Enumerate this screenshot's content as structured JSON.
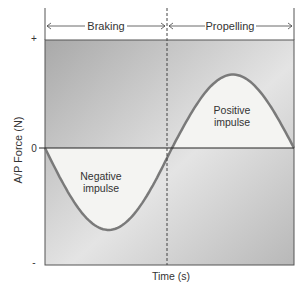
{
  "chart_data": {
    "type": "area",
    "title": "",
    "xlabel": "Time (s)",
    "ylabel": "A/P Force (N)",
    "y_ticks": [
      "+",
      "0",
      "-"
    ],
    "phases": [
      {
        "label": "Braking",
        "x_start": 0.0,
        "x_end": 0.49
      },
      {
        "label": "Propelling",
        "x_start": 0.49,
        "x_end": 1.0
      }
    ],
    "annotations": [
      {
        "label_line1": "Negative",
        "label_line2": "impulse"
      },
      {
        "label_line1": "Positive",
        "label_line2": "impulse"
      }
    ],
    "curve": {
      "description": "sinusoid-like force curve, negative in braking, positive in propelling",
      "zero_crossing_x": 0.51,
      "min": {
        "x": 0.23,
        "y": -0.7
      },
      "max": {
        "x": 0.75,
        "y": 0.68
      },
      "xlim": [
        0,
        1
      ],
      "ylim": [
        -1,
        1
      ]
    }
  }
}
